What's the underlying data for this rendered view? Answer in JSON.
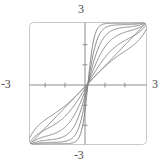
{
  "figure": {
    "kind": "math-plot",
    "background_color": "#ffffff",
    "frame": {
      "color": "#c8c8c8",
      "corner_radius": 4,
      "x_px": 29,
      "y_px": 22,
      "width_px": 118,
      "height_px": 123
    },
    "axis_color": "#8a8a8a",
    "curve_color": "#7f7f7f",
    "diagonal_color": "#8a8a8a",
    "label_color": "#4a4a4a"
  },
  "axis_labels": {
    "top": "3",
    "bottom": "-3",
    "left": "-3",
    "right": "3"
  },
  "chart_data": {
    "type": "line",
    "title": "",
    "xlabel": "",
    "ylabel": "",
    "xlim": [
      -3,
      3
    ],
    "ylim": [
      -3,
      3
    ],
    "grid": false,
    "legend": "none",
    "xticks": [
      -3,
      -2,
      -1,
      0,
      1,
      2,
      3
    ],
    "yticks": [
      -3,
      -2,
      -1,
      0,
      1,
      2,
      3
    ],
    "xtick_labels": [
      "-3",
      "",
      "",
      "",
      "",
      "",
      "3"
    ],
    "ytick_labels": [
      "-3",
      "",
      "",
      "",
      "",
      "",
      "3"
    ],
    "annotations": [
      "Family of sigmoid solution curves symmetric about the line y = x",
      "Straight diagonal line y = x passes through the origin"
    ],
    "series": [
      {
        "name": "y = x",
        "style": "straight-diagonal",
        "x": [
          -3,
          -2,
          -1,
          0,
          1,
          2,
          3
        ],
        "values": [
          -3,
          -2,
          -1,
          0,
          1,
          2,
          3
        ]
      },
      {
        "name": "curve-k1",
        "style": "sigmoid",
        "steepness": 1.35,
        "plateau": 2.25,
        "x": [
          -3,
          -2.4,
          -1.8,
          -1.2,
          -0.6,
          0,
          0.6,
          1.2,
          1.8,
          2.4,
          3
        ],
        "values": [
          -2.96,
          -2.6,
          -1.95,
          -1.1,
          -0.45,
          0,
          0.45,
          1.1,
          1.95,
          2.6,
          2.96
        ]
      },
      {
        "name": "curve-k2",
        "style": "sigmoid",
        "steepness": 2.0,
        "plateau": 2.45,
        "x": [
          -3,
          -2.4,
          -1.8,
          -1.2,
          -0.6,
          0,
          0.6,
          1.2,
          1.8,
          2.4,
          3
        ],
        "values": [
          -2.98,
          -2.8,
          -2.35,
          -1.45,
          -0.55,
          0,
          0.55,
          1.45,
          2.35,
          2.8,
          2.98
        ]
      },
      {
        "name": "curve-k3",
        "style": "sigmoid",
        "steepness": 2.9,
        "plateau": 2.62,
        "x": [
          -3,
          -2.4,
          -1.8,
          -1.2,
          -0.6,
          0,
          0.6,
          1.2,
          1.8,
          2.4,
          3
        ],
        "values": [
          -2.99,
          -2.9,
          -2.6,
          -1.8,
          -0.7,
          0,
          0.7,
          1.8,
          2.6,
          2.9,
          2.99
        ]
      },
      {
        "name": "curve-k4",
        "style": "sigmoid",
        "steepness": 4.2,
        "plateau": 2.76,
        "x": [
          -3,
          -2.4,
          -1.8,
          -1.2,
          -0.6,
          0,
          0.6,
          1.2,
          1.8,
          2.4,
          3
        ],
        "values": [
          -3.0,
          -2.95,
          -2.78,
          -2.15,
          -0.9,
          0,
          0.9,
          2.15,
          2.78,
          2.95,
          3.0
        ]
      },
      {
        "name": "curve-k5",
        "style": "sigmoid",
        "steepness": 6.2,
        "plateau": 2.87,
        "x": [
          -3,
          -2.4,
          -1.8,
          -1.2,
          -0.6,
          0,
          0.6,
          1.2,
          1.8,
          2.4,
          3
        ],
        "values": [
          -3.0,
          -2.98,
          -2.88,
          -2.5,
          -1.2,
          0,
          1.2,
          2.5,
          2.88,
          2.98,
          3.0
        ]
      },
      {
        "name": "curve-k6",
        "style": "sigmoid",
        "steepness": 9.5,
        "plateau": 2.94,
        "x": [
          -3,
          -2.4,
          -1.8,
          -1.2,
          -0.6,
          0,
          0.6,
          1.2,
          1.8,
          2.4,
          3
        ],
        "values": [
          -3.0,
          -2.99,
          -2.95,
          -2.75,
          -1.6,
          0,
          1.6,
          2.75,
          2.95,
          2.99,
          3.0
        ]
      }
    ]
  }
}
